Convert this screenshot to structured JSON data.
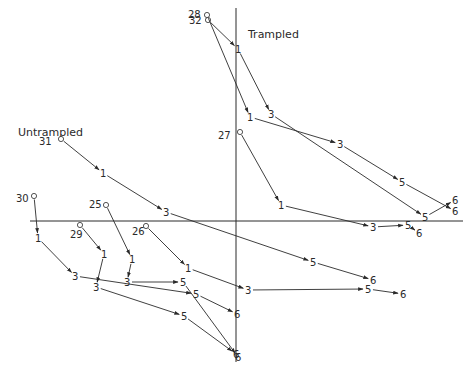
{
  "labels": {
    "trampled": "Trampled",
    "untrampled": "Untrampled"
  },
  "axes": {
    "horizontal": {
      "x1": 30,
      "y1": 221,
      "x2": 463,
      "y2": 221
    },
    "vertical": {
      "x1": 236,
      "y1": 8,
      "x2": 236,
      "y2": 362
    }
  },
  "group_labels_pos": {
    "trampled": {
      "x": 248,
      "y": 38
    },
    "untrampled": {
      "x": 18,
      "y": 136
    }
  },
  "trajectories": [
    {
      "group": "Trampled",
      "id": "32",
      "start": {
        "x": 208,
        "y": 20,
        "label_x": 189,
        "label_y": 24
      },
      "points": [
        {
          "label": "1",
          "x": 238,
          "y": 49
        },
        {
          "label": "3",
          "x": 271,
          "y": 114
        },
        {
          "label": "5",
          "x": 425,
          "y": 217
        },
        {
          "label": "6",
          "x": 455,
          "y": 200
        }
      ]
    },
    {
      "group": "Trampled",
      "id": "28",
      "start": {
        "x": 207,
        "y": 15,
        "label_x": 188,
        "label_y": 18
      },
      "points": [
        {
          "label": "1",
          "x": 250,
          "y": 117
        },
        {
          "label": "3",
          "x": 340,
          "y": 144
        },
        {
          "label": "5",
          "x": 402,
          "y": 182
        },
        {
          "label": "6",
          "x": 455,
          "y": 211
        }
      ]
    },
    {
      "group": "Trampled",
      "id": "27",
      "start": {
        "x": 240,
        "y": 132,
        "label_x": 218,
        "label_y": 139
      },
      "points": [
        {
          "label": "1",
          "x": 281,
          "y": 205
        },
        {
          "label": "3",
          "x": 373,
          "y": 227
        },
        {
          "label": "5",
          "x": 408,
          "y": 225
        },
        {
          "label": "6",
          "x": 419,
          "y": 233
        }
      ]
    },
    {
      "group": "Untrampled",
      "id": "31",
      "start": {
        "x": 61,
        "y": 139,
        "label_x": 39,
        "label_y": 145
      },
      "points": [
        {
          "label": "1",
          "x": 103,
          "y": 173
        },
        {
          "label": "3",
          "x": 166,
          "y": 212
        },
        {
          "label": "5",
          "x": 313,
          "y": 262
        },
        {
          "label": "6",
          "x": 373,
          "y": 280
        }
      ]
    },
    {
      "group": "Untrampled",
      "id": "30",
      "start": {
        "x": 34,
        "y": 196,
        "label_x": 16,
        "label_y": 202
      },
      "points": [
        {
          "label": "1",
          "x": 38,
          "y": 238
        },
        {
          "label": "3",
          "x": 75,
          "y": 276
        },
        {
          "label": "5",
          "x": 196,
          "y": 294
        },
        {
          "label": "6",
          "x": 237,
          "y": 314
        }
      ]
    },
    {
      "group": "Untrampled",
      "id": "29",
      "start": {
        "x": 80,
        "y": 225,
        "label_x": 70,
        "label_y": 238
      },
      "points": [
        {
          "label": "1",
          "x": 104,
          "y": 254
        },
        {
          "label": "3",
          "x": 96,
          "y": 287
        },
        {
          "label": "5",
          "x": 184,
          "y": 316
        },
        {
          "label": "6",
          "x": 236,
          "y": 354
        }
      ]
    },
    {
      "group": "Untrampled",
      "id": "25",
      "start": {
        "x": 106,
        "y": 205,
        "label_x": 89,
        "label_y": 208
      },
      "points": [
        {
          "label": "1",
          "x": 132,
          "y": 259
        },
        {
          "label": "3",
          "x": 127,
          "y": 282
        },
        {
          "label": "5",
          "x": 183,
          "y": 282
        },
        {
          "label": "6",
          "x": 238,
          "y": 357
        }
      ]
    },
    {
      "group": "Untrampled",
      "id": "26",
      "start": {
        "x": 146,
        "y": 226,
        "label_x": 132,
        "label_y": 235
      },
      "points": [
        {
          "label": "1",
          "x": 188,
          "y": 268
        },
        {
          "label": "3",
          "x": 248,
          "y": 290
        },
        {
          "label": "5",
          "x": 368,
          "y": 289
        },
        {
          "label": "6",
          "x": 403,
          "y": 294
        }
      ]
    }
  ]
}
